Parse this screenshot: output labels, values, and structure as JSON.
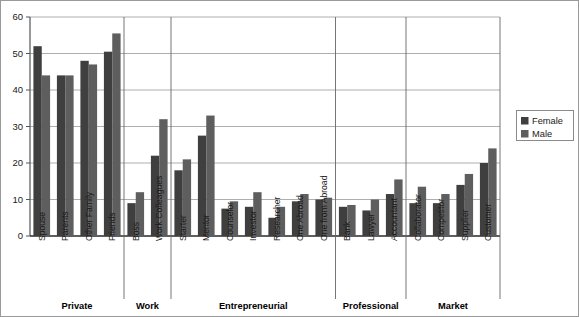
{
  "chart_data": {
    "type": "bar",
    "title": "",
    "xlabel": "",
    "ylabel": "",
    "ylim": [
      0,
      60
    ],
    "yticks": [
      0,
      10,
      20,
      30,
      40,
      50,
      60
    ],
    "grid": true,
    "legend_position": "right",
    "categories": [
      "Spouse",
      "Parents",
      "Other Family",
      "Friends",
      "Boss",
      "Work Colleagues",
      "Starter",
      "Mentor",
      "Counselor",
      "Investor",
      "Researcher",
      "One Abroad",
      "One from Abroad",
      "Bank",
      "Lawyer",
      "Accountant",
      "Collaborator",
      "Competitor",
      "Supplier",
      "Customer"
    ],
    "series": [
      {
        "name": "Female",
        "color": "#3f3f3f",
        "values": [
          52,
          44,
          48,
          50.5,
          9,
          22,
          18,
          27.5,
          7.5,
          8,
          5,
          9.5,
          10,
          8,
          7,
          11.5,
          9,
          9,
          14,
          20
        ]
      },
      {
        "name": "Male",
        "color": "#5e5e5e",
        "values": [
          44,
          44,
          47,
          55.5,
          12,
          32,
          21,
          33,
          9.5,
          12,
          8,
          11.5,
          10.5,
          8.5,
          10,
          15.5,
          13.5,
          11.5,
          17,
          24
        ]
      }
    ],
    "groups": [
      {
        "label": "Private",
        "start": 0,
        "count": 4
      },
      {
        "label": "Work",
        "start": 4,
        "count": 2
      },
      {
        "label": "Entrepreneurial",
        "start": 6,
        "count": 7
      },
      {
        "label": "Professional",
        "start": 13,
        "count": 3
      },
      {
        "label": "Market",
        "start": 16,
        "count": 4
      }
    ]
  },
  "legend": {
    "entries": [
      {
        "label": "Female",
        "color": "#3f3f3f"
      },
      {
        "label": "Male",
        "color": "#5e5e5e"
      }
    ]
  },
  "axis": {
    "y_max_label": "60",
    "y_min_label": "0"
  },
  "colors": {
    "female": "#3f3f3f",
    "male": "#5e5e5e",
    "grid": "#999999",
    "axis": "#555555",
    "border": "#9a9a9a",
    "background": "#ffffff"
  }
}
